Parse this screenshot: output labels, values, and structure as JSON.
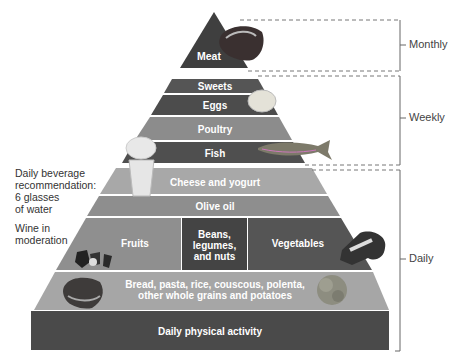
{
  "diagram": {
    "type": "food-pyramid",
    "colors": {
      "dark": "#4a4a4a",
      "mid": "#8a8a8a",
      "light": "#b8b8b8",
      "lighter": "#a4a4a4",
      "line": "#666666"
    },
    "tiers": {
      "meat": "Meat",
      "sweets": "Sweets",
      "eggs": "Eggs",
      "poultry": "Poultry",
      "fish": "Fish",
      "cheese": "Cheese and yogurt",
      "olive_oil": "Olive oil",
      "fruits": "Fruits",
      "beans_l1": "Beans,",
      "beans_l2": "legumes,",
      "beans_l3": "and nuts",
      "vegetables": "Vegetables",
      "grains_l1": "Bread, pasta, rice, couscous, polenta,",
      "grains_l2": "other whole grains and potatoes",
      "activity": "Daily physical activity"
    },
    "frequency": {
      "monthly": "Monthly",
      "weekly": "Weekly",
      "daily": "Daily"
    },
    "side_notes": {
      "beverage_l1": "Daily beverage",
      "beverage_l2": "recommendation:",
      "beverage_l3": "6 glasses",
      "beverage_l4": "of water",
      "wine_l1": "Wine in",
      "wine_l2": "moderation"
    },
    "images": [
      "steak",
      "egg",
      "fish",
      "water-glass",
      "strawberries",
      "broccoli",
      "bread",
      "grains"
    ]
  }
}
